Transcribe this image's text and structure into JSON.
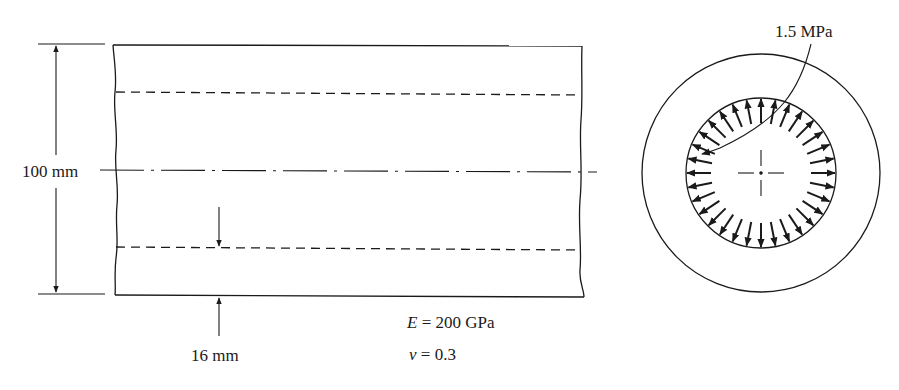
{
  "figure": {
    "side_view": {
      "diameter_label": "100 mm",
      "wall_thickness_label": "16 mm",
      "material": {
        "modulus_symbol": "E",
        "modulus_value": " = 200 GPa",
        "poisson_symbol": "ν",
        "poisson_value": " = 0.3"
      }
    },
    "cross_section": {
      "pressure_label": "1.5 MPa",
      "arrow_count": 32
    },
    "colors": {
      "ink": "#1a1a1a",
      "background": "#ffffff"
    }
  }
}
